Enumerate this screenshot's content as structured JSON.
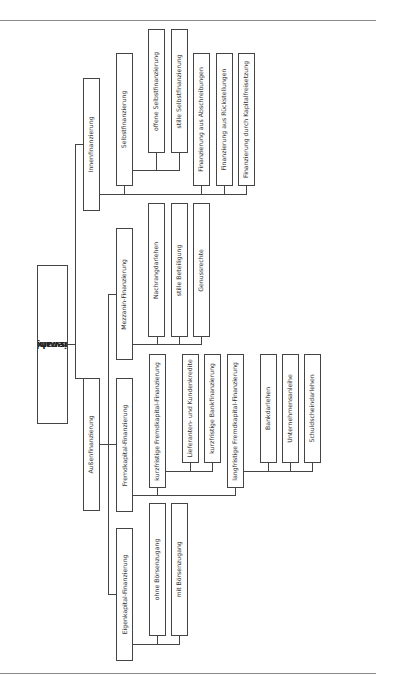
{
  "diagram": {
    "root": {
      "label_line1": "Finanzierungsformen",
      "label_line2": "(Auswahl)"
    },
    "innen": {
      "label": "Innenfinanzierung",
      "selbst": {
        "label": "Selbstfinanzierung",
        "children": [
          "offene Selbstfinanzierung",
          "stille Selbstfinanzierung"
        ]
      },
      "others": [
        "Finanzierung aus Abschreibungen",
        "Finanzierung aus Rückstellungen",
        "Finanzierung durch Kapitalfreisetzung"
      ]
    },
    "aussen": {
      "label": "Außenfinanzierung",
      "mezzanin": {
        "label": "Mezzanin-Finanzierung",
        "children": [
          "Nachrangdarlehen",
          "stille Beteiligung",
          "Genussrechte"
        ]
      },
      "fremd": {
        "label": "Fremdkapital-Finanzierung",
        "kurz": {
          "label": "kurzfristige Fremdkapital-Finanzierung",
          "children": [
            "Lieferanten- und Kundenkredite",
            "kurzfristige Bankfinanzierung"
          ]
        },
        "lang": {
          "label": "langfristige Fremdkapital-Finanzierung",
          "children": [
            "Bankdarlehen",
            "Unternehmensanleihe",
            "Schuldscheindarlehen"
          ]
        }
      },
      "eigen": {
        "label": "Eigenkapital-Finanzierung",
        "children": [
          "ohne Börsenzugang",
          "mit Börsenzugang"
        ]
      }
    }
  }
}
